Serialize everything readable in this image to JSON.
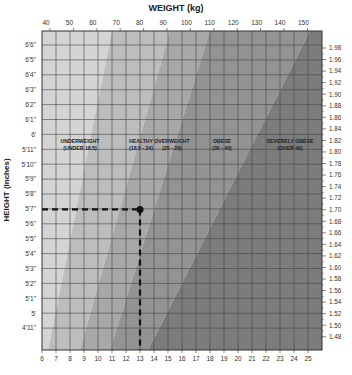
{
  "chart_data": {
    "type": "area",
    "title": "",
    "top_axis_title": "WEIGHT (kg)",
    "left_axis_title": "HEIGHT (inches)",
    "top_ticks": [
      "40",
      "50",
      "60",
      "70",
      "80",
      "90",
      "100",
      "110",
      "120",
      "130",
      "140",
      "150"
    ],
    "bottom_ticks": [
      "6",
      "7",
      "8",
      "9",
      "10",
      "11",
      "12",
      "13",
      "14",
      "15",
      "16",
      "17",
      "18",
      "19",
      "20",
      "21",
      "22",
      "23",
      "24",
      "25"
    ],
    "left_ticks": [
      "6'6\"",
      "6'5\"",
      "6'4\"",
      "6'3\"",
      "6'2\"",
      "6'1\"",
      "6'",
      "5'11\"",
      "5'10\"",
      "5'9\"",
      "5'8\"",
      "5'7\"",
      "5'6\"",
      "5'5\"",
      "5'4\"",
      "5'3\"",
      "5'2\"",
      "5'1\"",
      "5'",
      "4'11\""
    ],
    "right_ticks": [
      "1.98",
      "1.96",
      "1.94",
      "1.92",
      "1.90",
      "1.88",
      "1.86",
      "1.84",
      "1.82",
      "1.80",
      "1.78",
      "1.76",
      "1.74",
      "1.72",
      "1.70",
      "1.68",
      "1.66",
      "1.64",
      "1.62",
      "1.60",
      "1.58",
      "1.56",
      "1.54",
      "1.52",
      "1.50",
      "1.48"
    ],
    "xlim_kg": [
      38,
      157
    ],
    "xlim_stone": [
      6,
      25
    ],
    "ylim_m": [
      1.47,
      1.99
    ],
    "grid": true,
    "bands": [
      {
        "name": "UNDERWEIGHT",
        "range": "(UNDER 18.5)",
        "color": "#d4d4d4"
      },
      {
        "name": "HEALTHY",
        "range": "(18.5 - 24)",
        "color": "#bdbdbd"
      },
      {
        "name": "OVERWEIGHT",
        "range": "(25 - 29)",
        "color": "#a8a8a8"
      },
      {
        "name": "OBESE",
        "range": "(30 - 40)",
        "color": "#939393"
      },
      {
        "name": "SEVERELY OBESE",
        "range": "(OVER 40)",
        "color": "#7c7c7c"
      }
    ],
    "highlight_point": {
      "height": "5'7\"",
      "height_m": 1.7,
      "weight_stone": 13,
      "weight_kg": 82.5
    },
    "legend": "none"
  }
}
